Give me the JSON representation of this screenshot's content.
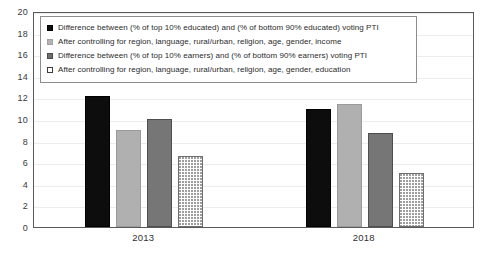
{
  "chart_data": {
    "type": "bar",
    "title": "",
    "subtitle": "",
    "xlabel": "",
    "ylabel": "",
    "categories": [
      "2013",
      "2018"
    ],
    "ylim": [
      0,
      20
    ],
    "yticks": [
      0,
      2,
      4,
      6,
      8,
      10,
      12,
      14,
      16,
      18,
      20
    ],
    "ytick_labels": [
      "0",
      "2",
      "4",
      "6",
      "8",
      "10",
      "12",
      "14",
      "16",
      "18",
      "20"
    ],
    "grid": true,
    "legend_position": "top-left-inside",
    "series": [
      {
        "name": "Difference between (% of top 10% educated) and (% of bottom 90% educated) voting PTI",
        "swatch": "s0",
        "color": "#0d0d0d",
        "values": [
          12.1,
          10.9
        ]
      },
      {
        "name": "After controlling for region, language, rural/urban, religion, age, gender, income",
        "swatch": "s1",
        "color": "#b0b0b0",
        "values": [
          9.0,
          11.4
        ]
      },
      {
        "name": "Difference between (% of top 10% earners) and (% of bottom 90% earners) voting PTI",
        "swatch": "s2",
        "color": "#767676",
        "values": [
          10.0,
          8.7
        ]
      },
      {
        "name": "After controlling for region, language, rural/urban, religion, age, gender, education",
        "swatch": "s3",
        "color": "#ffffff",
        "values": [
          6.6,
          5.0
        ]
      }
    ]
  }
}
